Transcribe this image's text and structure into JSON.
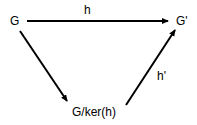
{
  "diagram": {
    "nodes": {
      "g": "G",
      "g_prime": "G'",
      "quotient": "G/ker(h)"
    },
    "edges": {
      "h": "h",
      "h_prime": "h'"
    }
  }
}
